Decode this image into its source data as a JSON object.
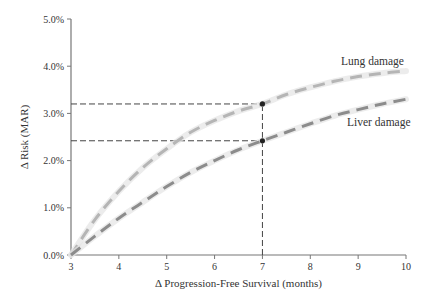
{
  "chart_data": {
    "type": "line",
    "title": "",
    "xlabel": "Δ Progression-Free Survival (months)",
    "ylabel": "Δ Risk (MAR)",
    "xlim": [
      3,
      10
    ],
    "ylim": [
      0,
      5
    ],
    "x_ticks": [
      3,
      4,
      5,
      6,
      7,
      8,
      9,
      10
    ],
    "x_tick_labels": [
      "3",
      "4",
      "5",
      "6",
      "7",
      "8",
      "9",
      "10"
    ],
    "y_ticks": [
      0,
      1,
      2,
      3,
      4,
      5
    ],
    "y_tick_labels": [
      "0.0%",
      "1.0%",
      "2.0%",
      "3.0%",
      "4.0%",
      "5.0%"
    ],
    "grid": false,
    "legend": "inline labels at line ends",
    "series": [
      {
        "name": "Lung damage",
        "color": "#b5b5b5",
        "style": "dashed",
        "x": [
          3,
          3.5,
          4,
          4.5,
          5,
          5.5,
          6,
          6.5,
          7,
          7.5,
          8,
          8.5,
          9,
          9.5,
          10
        ],
        "values": [
          0.0,
          0.75,
          1.35,
          1.85,
          2.25,
          2.6,
          2.85,
          3.05,
          3.2,
          3.4,
          3.55,
          3.68,
          3.78,
          3.85,
          3.9
        ]
      },
      {
        "name": "Liver damage",
        "color": "#8c8c8c",
        "style": "dashed",
        "x": [
          3,
          3.5,
          4,
          4.5,
          5,
          5.5,
          6,
          6.5,
          7,
          7.5,
          8,
          8.5,
          9,
          9.5,
          10
        ],
        "values": [
          0.0,
          0.4,
          0.78,
          1.12,
          1.45,
          1.75,
          2.0,
          2.23,
          2.42,
          2.6,
          2.78,
          2.95,
          3.08,
          3.2,
          3.3
        ]
      }
    ],
    "annotations": [
      {
        "type": "vline-dashed",
        "x": 7,
        "from": 0,
        "to": 3.2
      },
      {
        "type": "hline-dashed",
        "y": 3.2,
        "from": 3,
        "to": 7,
        "label": "Lung damage at 7 months"
      },
      {
        "type": "hline-dashed",
        "y": 2.42,
        "from": 3,
        "to": 7,
        "label": "Liver damage at 7 months"
      },
      {
        "type": "point",
        "x": 7,
        "y": 3.2
      },
      {
        "type": "point",
        "x": 7,
        "y": 2.42
      }
    ]
  }
}
